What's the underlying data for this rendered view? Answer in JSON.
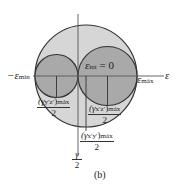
{
  "diagram": {
    "type": "mohr-circle-strain",
    "caption": "(b)",
    "colors": {
      "outer_fill": "#d6d6d6",
      "inner_fill": "#a9a9a9",
      "stroke": "#333333",
      "axis": "#555555",
      "background": "#ffffff"
    },
    "axes": {
      "x_label": "ε",
      "y_label_num": "γ",
      "y_label_den": "2"
    },
    "labels": {
      "eps_min_prefix": "−ε",
      "eps_min_sub": "mín",
      "eps_max": "ε",
      "eps_max_sub": "máx",
      "eps_int": "ε",
      "eps_int_sub": "int",
      "eps_int_value": " = 0"
    },
    "fractions": [
      {
        "num": "(γ",
        "num_sub1": "y′z′",
        "num_close": ")",
        "num_sub2": "máx",
        "den": "2"
      },
      {
        "num": "(γ",
        "num_sub1": "x′z′",
        "num_close": ")",
        "num_sub2": "máx",
        "den": "2"
      },
      {
        "num": "(γ",
        "num_sub1": "x′y′",
        "num_close": ")",
        "num_sub2": "máx",
        "den": "2"
      }
    ]
  }
}
